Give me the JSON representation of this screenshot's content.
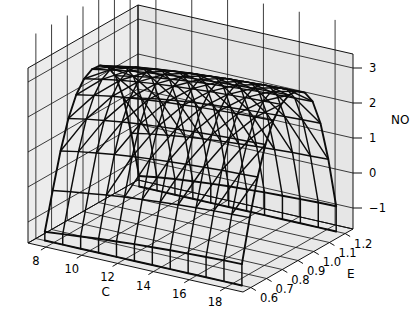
{
  "figure": {
    "type": "3d-surface-wireframe",
    "background_color": "#ffffff",
    "panel_color": "#e8e8e8",
    "mesh_color": "#0c0c0c",
    "grid_color": "#1a1a1a"
  },
  "axes": {
    "x": {
      "name": "C",
      "label": "C",
      "ticks": [
        "8",
        "10",
        "12",
        "14",
        "16",
        "18"
      ],
      "tick_values": [
        8,
        10,
        12,
        14,
        16,
        18
      ],
      "range": [
        7,
        19
      ]
    },
    "y": {
      "name": "E",
      "label": "E",
      "ticks": [
        "0.6",
        "0.7",
        "0.8",
        "0.9",
        "1.0",
        "1.1",
        "1.2"
      ],
      "tick_values": [
        0.6,
        0.7,
        0.8,
        0.9,
        1.0,
        1.1,
        1.2
      ],
      "range": [
        0.55,
        1.25
      ]
    },
    "z": {
      "name": "NO",
      "label": "NO",
      "ticks": [
        "3",
        "2",
        "1",
        "0",
        "-1"
      ],
      "tick_values": [
        3,
        2,
        1,
        0,
        -1
      ],
      "range": [
        -1.6,
        3.4
      ]
    }
  },
  "chart_data": {
    "type": "surface",
    "title": "",
    "xlabel": "C",
    "ylabel": "E",
    "zlabel": "NO",
    "xlim": [
      7,
      19
    ],
    "ylim": [
      0.55,
      1.25
    ],
    "zlim": [
      -1.6,
      3.4
    ],
    "grid": true,
    "legend": "none",
    "x": [
      7.5,
      8.5,
      9.5,
      10.5,
      11.5,
      12.5,
      13.5,
      14.5,
      15.5,
      16.5,
      17.5,
      18.5
    ],
    "y": [
      0.6,
      0.65,
      0.7,
      0.75,
      0.8,
      0.85,
      0.9,
      0.95,
      1.0,
      1.05,
      1.1,
      1.15,
      1.2
    ],
    "z": [
      [
        -1.35,
        -0.3,
        0.7,
        1.5,
        2.05,
        2.38,
        2.52,
        2.5,
        2.33,
        1.95,
        1.2,
        0.05,
        -1.3
      ],
      [
        -1.3,
        -0.22,
        0.8,
        1.6,
        2.15,
        2.48,
        2.62,
        2.6,
        2.43,
        2.05,
        1.3,
        0.15,
        -1.22
      ],
      [
        -1.25,
        -0.15,
        0.88,
        1.68,
        2.24,
        2.57,
        2.71,
        2.69,
        2.52,
        2.14,
        1.39,
        0.23,
        -1.15
      ],
      [
        -1.2,
        -0.08,
        0.95,
        1.75,
        2.31,
        2.64,
        2.78,
        2.76,
        2.59,
        2.21,
        1.46,
        0.3,
        -1.1
      ],
      [
        -1.16,
        -0.02,
        1.01,
        1.81,
        2.37,
        2.7,
        2.84,
        2.82,
        2.65,
        2.27,
        1.52,
        0.36,
        -1.05
      ],
      [
        -1.12,
        0.03,
        1.06,
        1.86,
        2.42,
        2.75,
        2.89,
        2.87,
        2.7,
        2.32,
        1.57,
        0.41,
        -1.01
      ],
      [
        -1.09,
        0.07,
        1.1,
        1.9,
        2.46,
        2.79,
        2.93,
        2.91,
        2.74,
        2.36,
        1.61,
        0.45,
        -0.98
      ],
      [
        -1.06,
        0.11,
        1.14,
        1.94,
        2.5,
        2.83,
        2.97,
        2.95,
        2.78,
        2.4,
        1.65,
        0.49,
        -0.95
      ],
      [
        -1.04,
        0.14,
        1.17,
        1.97,
        2.53,
        2.86,
        3.0,
        2.98,
        2.81,
        2.43,
        1.68,
        0.52,
        -0.93
      ],
      [
        -1.02,
        0.17,
        1.2,
        2.0,
        2.56,
        2.89,
        3.03,
        3.01,
        2.84,
        2.46,
        1.71,
        0.55,
        -0.91
      ],
      [
        -1.0,
        0.19,
        1.22,
        2.02,
        2.58,
        2.91,
        3.05,
        3.03,
        2.86,
        2.48,
        1.73,
        0.57,
        -0.89
      ],
      [
        -0.99,
        0.21,
        1.24,
        2.04,
        2.6,
        2.93,
        3.07,
        3.05,
        2.88,
        2.5,
        1.75,
        0.59,
        -0.88
      ]
    ]
  },
  "view": {
    "theta_deg": 40,
    "phi_deg": 22,
    "z_exaggeration": 1.0
  }
}
